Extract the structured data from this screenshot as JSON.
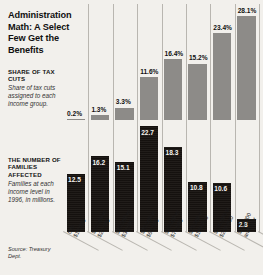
{
  "title": "Administration Math: A Select Few Get the Benefits",
  "sections": {
    "share": {
      "heading": "SHARE OF TAX CUTS",
      "description": "Share of tax cuts assigned to each income group."
    },
    "families": {
      "heading": "THE NUMBER OF FAMILIES AFFECTED",
      "description": "Families at each income level in 1996, in millions."
    }
  },
  "source": "Source: Treasury Dept.",
  "chart_data": {
    "type": "bar",
    "title": "Administration Math: A Select Few Get the Benefits",
    "xlabel": "",
    "ylabel": "",
    "grid": false,
    "legend_position": "left-labels",
    "categories": [
      "0 to $10,000",
      "$10,000 to $20,000",
      "$20,000 to $30,000",
      "$30,000 to $50,000",
      "$50,000 to $75,000",
      "$75,000 to $100,000",
      "$100,000 to $200,000",
      "$200,000 and over"
    ],
    "category_lines": [
      [
        "0 to",
        "$10,000"
      ],
      [
        "$10,000 to",
        "$20,000"
      ],
      [
        "$20,000 to",
        "$30,000"
      ],
      [
        "$30,000 to",
        "$50,000"
      ],
      [
        "$50,000 to",
        "$75,000"
      ],
      [
        "$75,000 to",
        "$100,000"
      ],
      [
        "$100,000 to",
        "$200,000"
      ],
      [
        "$200,000",
        "and over"
      ]
    ],
    "series": [
      {
        "name": "Share of tax cuts",
        "unit": "%",
        "color": "#8d8b88",
        "values": [
          0.2,
          1.3,
          3.3,
          11.6,
          16.4,
          15.2,
          23.4,
          28.1
        ],
        "labels": [
          "0.2%",
          "1.3%",
          "3.3%",
          "11.6%",
          "16.4%",
          "15.2%",
          "23.4%",
          "28.1%"
        ],
        "ylim": [
          0,
          28.1
        ]
      },
      {
        "name": "Number of families affected",
        "unit": "millions",
        "color": "#171310",
        "values": [
          12.5,
          16.2,
          15.1,
          22.7,
          18.3,
          10.8,
          10.6,
          2.8
        ],
        "labels": [
          "12.5",
          "16.2",
          "15.1",
          "22.7",
          "18.3",
          "10.8",
          "10.6",
          "2.8"
        ],
        "ylim": [
          0,
          22.7
        ]
      }
    ]
  }
}
